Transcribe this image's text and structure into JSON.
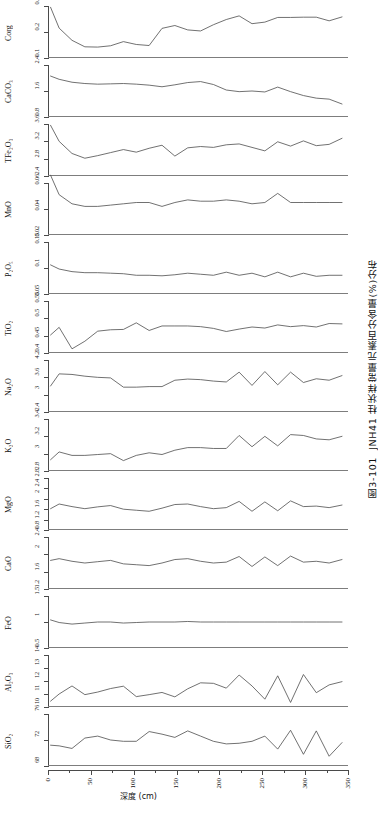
{
  "caption": {
    "figure_number": "图3-101",
    "text": "JNH41 柱状样常量元素百分含量(%)分布"
  },
  "axes": {
    "x_title": "深度 (cm)",
    "x_ticks": [
      0,
      50,
      100,
      150,
      200,
      250,
      300,
      350
    ],
    "x_min": 0,
    "x_max": 350
  },
  "chart_data": {
    "type": "line",
    "title": "图3-101  JNH41 柱状样常量元素百分含量(%)分布",
    "xlabel": "深度 (cm)",
    "ylabel": "百分含量 (%)",
    "grid": false,
    "legend": "none",
    "orientation": "stacked-panels-vertical",
    "xlim": [
      0,
      350
    ],
    "x": [
      3,
      13,
      28,
      43,
      58,
      73,
      88,
      103,
      118,
      133,
      148,
      163,
      178,
      193,
      208,
      223,
      238,
      253,
      268,
      283,
      298,
      313,
      328,
      343
    ],
    "panels": [
      {
        "name": "Corg",
        "label": "Corg",
        "ylim": [
          0.1,
          0.3
        ],
        "yticks": [
          0.1,
          0.2,
          0.3
        ],
        "values": [
          0.295,
          0.215,
          0.168,
          0.143,
          0.142,
          0.147,
          0.163,
          0.152,
          0.148,
          0.214,
          0.225,
          0.208,
          0.204,
          0.228,
          0.248,
          0.262,
          0.232,
          0.238,
          0.256,
          0.256,
          0.257,
          0.257,
          0.243,
          0.258
        ]
      },
      {
        "name": "CaCO3",
        "label": "CaCO₃",
        "ylim": [
          0.8,
          2.4
        ],
        "yticks": [
          0.8,
          1.6,
          2.4
        ],
        "values": [
          2.06,
          1.96,
          1.87,
          1.83,
          1.81,
          1.82,
          1.83,
          1.81,
          1.78,
          1.73,
          1.79,
          1.86,
          1.89,
          1.8,
          1.63,
          1.58,
          1.6,
          1.57,
          1.72,
          1.58,
          1.46,
          1.38,
          1.35,
          1.2
        ]
      },
      {
        "name": "TFe2O3",
        "label": "TFe₂O₃",
        "ylim": [
          2.4,
          3.6
        ],
        "yticks": [
          2.4,
          2.8,
          3.2,
          3.6
        ],
        "values": [
          3.57,
          3.2,
          2.92,
          2.81,
          2.87,
          2.94,
          3.01,
          2.95,
          3.04,
          3.11,
          2.86,
          3.05,
          3.08,
          3.06,
          3.12,
          3.14,
          3.06,
          2.98,
          3.19,
          3.09,
          3.21,
          3.1,
          3.13,
          3.27
        ]
      },
      {
        "name": "MnO",
        "label": "MnO",
        "ylim": [
          0.02,
          0.06
        ],
        "yticks": [
          0.02,
          0.04,
          0.06
        ],
        "values": [
          0.066,
          0.051,
          0.044,
          0.042,
          0.042,
          0.043,
          0.044,
          0.045,
          0.045,
          0.042,
          0.045,
          0.047,
          0.046,
          0.046,
          0.047,
          0.046,
          0.044,
          0.045,
          0.052,
          0.045,
          0.045,
          0.045,
          0.045,
          0.045
        ]
      },
      {
        "name": "P2O5",
        "label": "P₂O₅",
        "ylim": [
          0.05,
          0.15
        ],
        "yticks": [
          0.05,
          0.1,
          0.15
        ],
        "values": [
          0.106,
          0.098,
          0.093,
          0.091,
          0.091,
          0.09,
          0.089,
          0.086,
          0.086,
          0.085,
          0.087,
          0.09,
          0.088,
          0.086,
          0.092,
          0.086,
          0.09,
          0.083,
          0.092,
          0.083,
          0.09,
          0.084,
          0.086,
          0.086
        ]
      },
      {
        "name": "TiO2",
        "label": "TiO₂",
        "ylim": [
          0.4,
          0.55
        ],
        "yticks": [
          0.4,
          0.45,
          0.5,
          0.55
        ],
        "values": [
          0.452,
          0.474,
          0.412,
          0.434,
          0.463,
          0.467,
          0.468,
          0.487,
          0.465,
          0.478,
          0.478,
          0.478,
          0.476,
          0.471,
          0.462,
          0.469,
          0.475,
          0.472,
          0.481,
          0.476,
          0.479,
          0.475,
          0.485,
          0.484
        ]
      },
      {
        "name": "Na2O",
        "label": "Na₂O",
        "ylim": [
          2.4,
          4.2
        ],
        "yticks": [
          2.4,
          3.0,
          3.6,
          4.2
        ],
        "values": [
          3.3,
          3.72,
          3.7,
          3.64,
          3.6,
          3.58,
          3.26,
          3.26,
          3.28,
          3.28,
          3.5,
          3.54,
          3.52,
          3.47,
          3.44,
          3.78,
          3.32,
          3.8,
          3.34,
          3.78,
          3.42,
          3.55,
          3.5,
          3.66
        ]
      },
      {
        "name": "K2O",
        "label": "K₂O",
        "ylim": [
          2.8,
          3.4
        ],
        "yticks": [
          2.8,
          3.0,
          3.2,
          3.4
        ],
        "values": [
          2.93,
          3.02,
          2.98,
          2.98,
          2.99,
          3.0,
          2.92,
          2.98,
          3.01,
          2.99,
          3.04,
          3.07,
          3.07,
          3.06,
          3.06,
          3.21,
          3.08,
          3.2,
          3.09,
          3.22,
          3.21,
          3.17,
          3.16,
          3.2
        ]
      },
      {
        "name": "MgO",
        "label": "MgO",
        "ylim": [
          0.8,
          2.8
        ],
        "yticks": [
          0.8,
          1.2,
          1.6,
          2.0,
          2.4,
          2.8
        ],
        "values": [
          1.62,
          1.8,
          1.7,
          1.62,
          1.69,
          1.74,
          1.6,
          1.56,
          1.52,
          1.64,
          1.78,
          1.8,
          1.7,
          1.62,
          1.66,
          1.9,
          1.52,
          1.88,
          1.54,
          1.92,
          1.7,
          1.72,
          1.66,
          1.76
        ]
      },
      {
        "name": "CaO",
        "label": "CaO",
        "ylim": [
          1.2,
          2.4
        ],
        "yticks": [
          1.2,
          1.6,
          2.0,
          2.4
        ],
        "values": [
          1.86,
          1.9,
          1.84,
          1.8,
          1.83,
          1.86,
          1.78,
          1.76,
          1.74,
          1.8,
          1.88,
          1.9,
          1.84,
          1.8,
          1.82,
          1.95,
          1.72,
          1.94,
          1.74,
          1.96,
          1.82,
          1.84,
          1.8,
          1.88
        ]
      },
      {
        "name": "FeO",
        "label": "FeO",
        "ylim": [
          0.5,
          1.5
        ],
        "yticks": [
          0.5,
          1.0,
          1.5
        ],
        "values": [
          1.04,
          0.99,
          0.96,
          0.98,
          1.0,
          1.0,
          0.98,
          0.99,
          1.0,
          1.0,
          1.0,
          1.01,
          1.0,
          1.0,
          1.0,
          1.0,
          1.0,
          1.0,
          1.0,
          1.0,
          1.0,
          1.0,
          1.0,
          1.0
        ]
      },
      {
        "name": "Al2O3",
        "label": "Al₂O₃",
        "ylim": [
          10,
          14
        ],
        "yticks": [
          10,
          11,
          12,
          13,
          14
        ],
        "values": [
          10.45,
          11.0,
          11.62,
          10.95,
          11.15,
          11.42,
          11.6,
          10.8,
          10.95,
          11.12,
          10.78,
          11.4,
          11.86,
          11.82,
          11.45,
          12.46,
          11.62,
          10.6,
          12.4,
          10.35,
          12.5,
          11.1,
          11.7,
          11.95
        ]
      },
      {
        "name": "SiO2",
        "label": "SiO₂",
        "ylim": [
          68,
          76
        ],
        "yticks": [
          68,
          72,
          76
        ],
        "values": [
          71.2,
          71.1,
          70.7,
          72.3,
          72.6,
          72.0,
          71.8,
          71.8,
          73.3,
          72.9,
          72.4,
          73.4,
          72.6,
          71.8,
          71.4,
          71.5,
          71.8,
          72.6,
          70.6,
          73.5,
          69.8,
          73.4,
          69.5,
          71.6
        ]
      }
    ]
  }
}
